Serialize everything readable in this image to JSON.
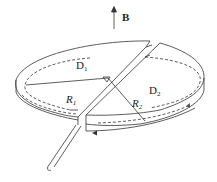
{
  "diagram": {
    "title": "",
    "field": {
      "label": "B",
      "direction": "up"
    },
    "regions": [
      {
        "id": "D1",
        "base": "D",
        "sub": "1"
      },
      {
        "id": "D2",
        "base": "D",
        "sub": "2"
      }
    ],
    "radii": [
      {
        "id": "R1",
        "base": "R",
        "sub": "1"
      },
      {
        "id": "R2",
        "base": "R",
        "sub": "2"
      }
    ],
    "path": {
      "style": "dashed",
      "arrow_direction": "left"
    },
    "colors": {
      "stroke": "#333333",
      "background": "#ffffff"
    }
  }
}
